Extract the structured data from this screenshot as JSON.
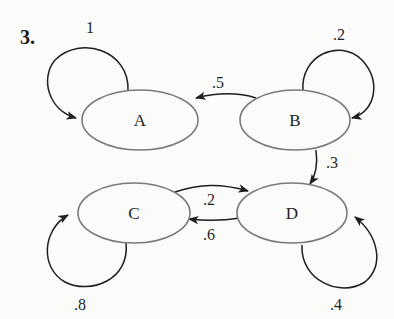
{
  "problem": {
    "number": "3."
  },
  "colors": {
    "background": "#fbfbf9",
    "node_stroke": "#7a7a7a",
    "edge_stroke": "#1e1e1e",
    "text": "#1e1e1e"
  },
  "nodes": [
    {
      "id": "A",
      "label": "A"
    },
    {
      "id": "B",
      "label": "B"
    },
    {
      "id": "C",
      "label": "C"
    },
    {
      "id": "D",
      "label": "D"
    }
  ],
  "edges": [
    {
      "from": "A",
      "to": "A",
      "label": "1"
    },
    {
      "from": "B",
      "to": "B",
      "label": ".2"
    },
    {
      "from": "B",
      "to": "A",
      "label": ".5"
    },
    {
      "from": "B",
      "to": "D",
      "label": ".3"
    },
    {
      "from": "C",
      "to": "D",
      "label": ".2"
    },
    {
      "from": "D",
      "to": "C",
      "label": ".6"
    },
    {
      "from": "C",
      "to": "C",
      "label": ".8"
    },
    {
      "from": "D",
      "to": "D",
      "label": ".4"
    }
  ]
}
